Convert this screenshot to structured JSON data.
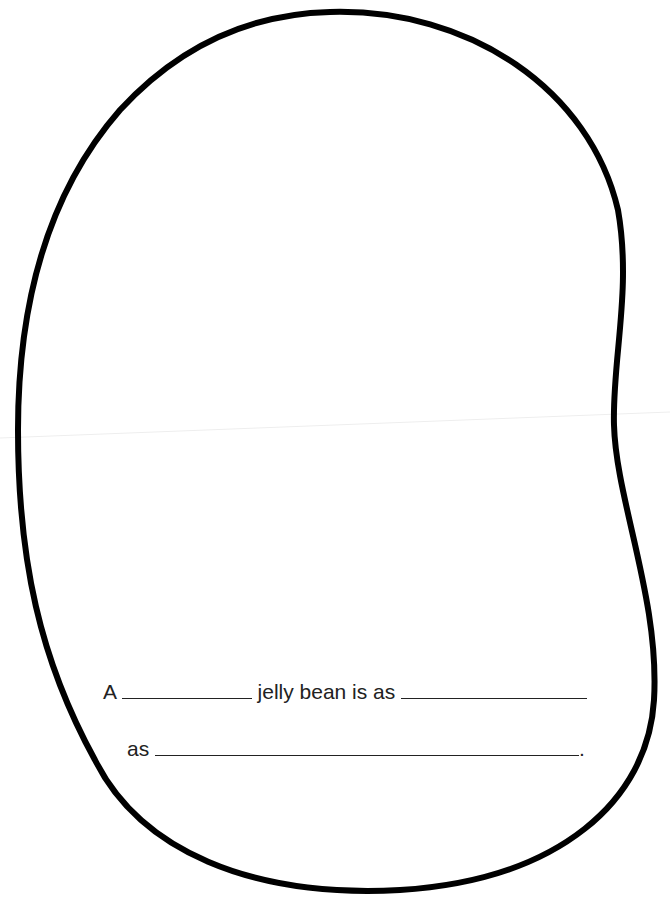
{
  "worksheet": {
    "shape": "jelly-bean-outline",
    "sentence": {
      "line1_prefix": "A",
      "line1_middle": "jelly bean is as",
      "line2_prefix": "as",
      "line2_suffix": "."
    },
    "colors": {
      "outline": "#000000",
      "text": "#222222",
      "background": "#ffffff"
    }
  }
}
